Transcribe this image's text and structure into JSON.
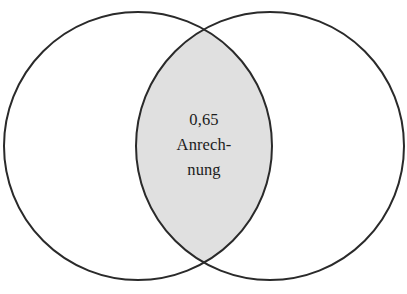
{
  "diagram": {
    "type": "venn-two-set",
    "background_color": "#ffffff",
    "stroke_color": "#2a2a2a",
    "stroke_width": 2,
    "intersection_fill_color": "#e0e0e0",
    "circles": [
      {
        "name": "left-set",
        "label": "",
        "center_x": 138,
        "center_y": 146,
        "radius": 134,
        "fill": "#ffffff"
      },
      {
        "name": "right-set",
        "label": "",
        "center_x": 270,
        "center_y": 146,
        "radius": 134,
        "fill": "#ffffff"
      }
    ],
    "intersection": {
      "name": "intersection-region",
      "value": "0,65",
      "caption_line_1": "Anrech-",
      "caption_line_2": "nung",
      "caption_full": "Anrechnung"
    }
  }
}
